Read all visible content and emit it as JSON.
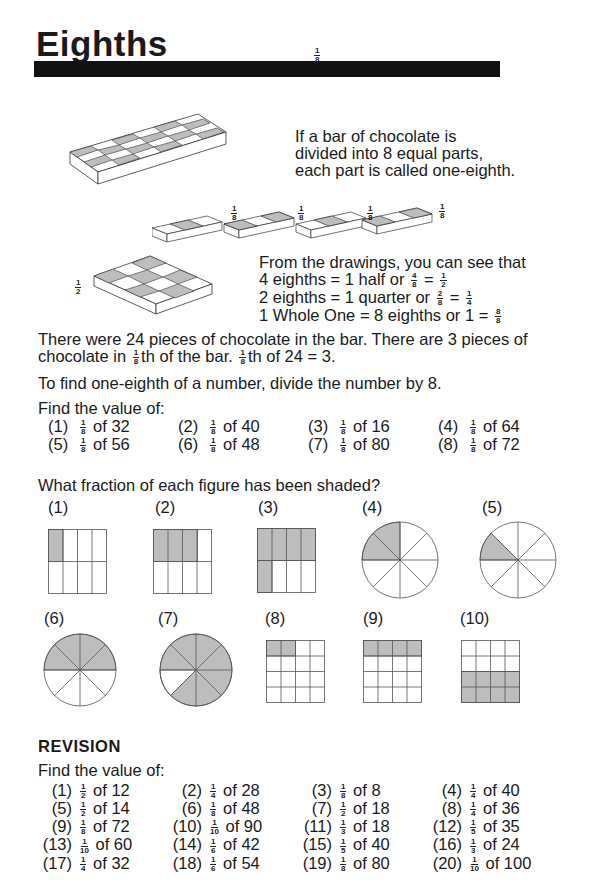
{
  "header": {
    "title": "Eighths",
    "title_fraction": {
      "num": "1",
      "den": "8"
    }
  },
  "illustrations": {
    "bar_fraction_labels": [
      {
        "num": "1",
        "den": "8"
      },
      {
        "num": "1",
        "den": "8"
      },
      {
        "num": "1",
        "den": "8"
      },
      {
        "num": "1",
        "den": "8"
      }
    ],
    "half_label": {
      "num": "1",
      "den": "2"
    }
  },
  "intro": {
    "line1": "If a bar of chocolate is",
    "line2": "divided into 8 equal parts,",
    "line3": "each part is called one-eighth."
  },
  "drawings": {
    "line1": "From the drawings, you can see that",
    "line2_a": "4 eighths = 1  half  or ",
    "line2_f1": {
      "num": "4",
      "den": "8"
    },
    "line2_eq": " = ",
    "line2_f2": {
      "num": "1",
      "den": "2"
    },
    "line3_a": "2 eighths = 1  quarter  or ",
    "line3_f1": {
      "num": "2",
      "den": "8"
    },
    "line3_eq": " = ",
    "line3_f2": {
      "num": "1",
      "den": "4"
    },
    "line4_a": "1 Whole One = 8 eighths or 1 = ",
    "line4_f1": {
      "num": "8",
      "den": "8"
    }
  },
  "explanation": {
    "line1": "There were 24 pieces of chocolate in the bar. There are 3 pieces of",
    "line2_a": "chocolate in ",
    "frac": {
      "num": "1",
      "den": "8"
    },
    "line2_b": "th of the bar. ",
    "line2_c": "th of 24 = 3.",
    "rule": "To find one-eighth of a number, divide the number by 8."
  },
  "exercise1": {
    "heading": "Find the value of:",
    "items": [
      {
        "n": "(1)",
        "num": "1",
        "den": "8",
        "text": "of 32"
      },
      {
        "n": "(2)",
        "num": "1",
        "den": "8",
        "text": "of 40"
      },
      {
        "n": "(3)",
        "num": "1",
        "den": "8",
        "text": "of 16"
      },
      {
        "n": "(4)",
        "num": "1",
        "den": "8",
        "text": "of 64"
      },
      {
        "n": "(5)",
        "num": "1",
        "den": "8",
        "text": "of 56"
      },
      {
        "n": "(6)",
        "num": "1",
        "den": "8",
        "text": "of 48"
      },
      {
        "n": "(7)",
        "num": "1",
        "den": "8",
        "text": "of 80"
      },
      {
        "n": "(8)",
        "num": "1",
        "den": "8",
        "text": "of 72"
      }
    ]
  },
  "figures": {
    "question": "What fraction of each figure has been shaded?",
    "labels": [
      "(1)",
      "(2)",
      "(3)",
      "(4)",
      "(5)",
      "(6)",
      "(7)",
      "(8)",
      "(9)",
      "(10)"
    ]
  },
  "revision": {
    "heading": "REVISION",
    "subheading": "Find the value of:",
    "items": [
      {
        "n": "(1)",
        "num": "1",
        "den": "2",
        "text": "of 12"
      },
      {
        "n": "(2)",
        "num": "1",
        "den": "4",
        "text": "of 28"
      },
      {
        "n": "(3)",
        "num": "1",
        "den": "8",
        "text": "of 8"
      },
      {
        "n": "(4)",
        "num": "1",
        "den": "4",
        "text": "of 40"
      },
      {
        "n": "(5)",
        "num": "1",
        "den": "2",
        "text": "of 14"
      },
      {
        "n": "(6)",
        "num": "1",
        "den": "8",
        "text": "of 48"
      },
      {
        "n": "(7)",
        "num": "1",
        "den": "2",
        "text": "of 18"
      },
      {
        "n": "(8)",
        "num": "1",
        "den": "4",
        "text": "of 36"
      },
      {
        "n": "(9)",
        "num": "1",
        "den": "8",
        "text": "of 72"
      },
      {
        "n": "(10)",
        "num": "1",
        "den": "10",
        "text": "of 90"
      },
      {
        "n": "(11)",
        "num": "1",
        "den": "3",
        "text": "of 18"
      },
      {
        "n": "(12)",
        "num": "1",
        "den": "5",
        "text": "of 35"
      },
      {
        "n": "(13)",
        "num": "1",
        "den": "10",
        "text": "of 60"
      },
      {
        "n": "(14)",
        "num": "1",
        "den": "6",
        "text": "of 42"
      },
      {
        "n": "(15)",
        "num": "1",
        "den": "5",
        "text": "of 40"
      },
      {
        "n": "(16)",
        "num": "1",
        "den": "3",
        "text": "of 24"
      },
      {
        "n": "(17)",
        "num": "1",
        "den": "4",
        "text": "of 32"
      },
      {
        "n": "(18)",
        "num": "1",
        "den": "6",
        "text": "of 54"
      },
      {
        "n": "(19)",
        "num": "1",
        "den": "8",
        "text": "of 80"
      },
      {
        "n": "(20)",
        "num": "1",
        "den": "10",
        "text": "of 100"
      }
    ]
  }
}
